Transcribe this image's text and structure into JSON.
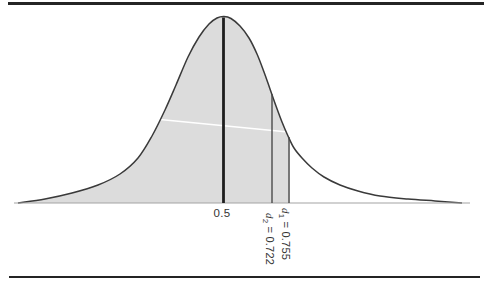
{
  "figure": {
    "background": "#ffffff",
    "rule_color": "#242424"
  },
  "labels": {
    "median": "0.5",
    "d1": {
      "var": "d",
      "sub": "1",
      "rest": " = 0.755"
    },
    "d2": {
      "var": "d",
      "sub": "2",
      "rest": " = 0.722"
    }
  },
  "chart_data": {
    "type": "area",
    "title": "",
    "x_axis": {
      "tick_labels": [
        "0.5"
      ],
      "grid": false
    },
    "markers": [
      {
        "name": "median",
        "label": "0.5",
        "value": 0.5,
        "x_px": 223.5,
        "top_px": 17.5,
        "style": "thick"
      },
      {
        "name": "d2",
        "label": "d2 = 0.722",
        "value": 0.722,
        "x_px": 272,
        "top_px": 94,
        "style": "thin"
      },
      {
        "name": "d1",
        "label": "d1 = 0.755",
        "value": 0.755,
        "x_px": 289,
        "top_px": 137,
        "style": "thin"
      }
    ],
    "shaded_region": {
      "from": "left tail",
      "to_value": 0.755,
      "to_x_px": 289.8
    },
    "baseline_y_px": 203,
    "baseline_x_px": [
      14,
      470
    ],
    "curve_points_px": [
      [
        18,
        203
      ],
      [
        45,
        199
      ],
      [
        72,
        193
      ],
      [
        98,
        185
      ],
      [
        120,
        174
      ],
      [
        138,
        158
      ],
      [
        152,
        136
      ],
      [
        165,
        110
      ],
      [
        176,
        85
      ],
      [
        188,
        57
      ],
      [
        199,
        37
      ],
      [
        209,
        24
      ],
      [
        217,
        18
      ],
      [
        224,
        16.5
      ],
      [
        231,
        18.5
      ],
      [
        240,
        26
      ],
      [
        249,
        38
      ],
      [
        257,
        54
      ],
      [
        264,
        72
      ],
      [
        270,
        89
      ],
      [
        276,
        106
      ],
      [
        282,
        122
      ],
      [
        288,
        136
      ],
      [
        294,
        148
      ],
      [
        302,
        158
      ],
      [
        312,
        168
      ],
      [
        324,
        177
      ],
      [
        340,
        185
      ],
      [
        358,
        191
      ],
      [
        380,
        196
      ],
      [
        408,
        199
      ],
      [
        435,
        201
      ],
      [
        462,
        203
      ]
    ],
    "artifact_line_px": [
      [
        104,
        114
      ],
      [
        298,
        133
      ]
    ],
    "colors": {
      "fill": "#dcdcdc",
      "stroke": "#3a3a3a",
      "baseline": "#a3a3a3",
      "thick_line": "#1e1e1e",
      "thin_line": "#4a4a4a",
      "artifact": "#ffffff"
    }
  }
}
